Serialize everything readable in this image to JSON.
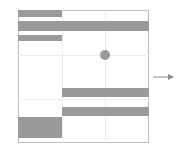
{
  "diagram": {
    "type": "grid-layout",
    "colors": {
      "fill": "#9a9a9a",
      "border": "#bdbdbd",
      "grid": "#ececec"
    },
    "bars": [
      {
        "id": "bar-1",
        "x": 18,
        "y": 10,
        "w": 44,
        "h": 7
      },
      {
        "id": "bar-2",
        "x": 18,
        "y": 21,
        "w": 131,
        "h": 10
      },
      {
        "id": "bar-3",
        "x": 18,
        "y": 35,
        "w": 44,
        "h": 6
      },
      {
        "id": "bar-4",
        "x": 62,
        "y": 88,
        "w": 87,
        "h": 9
      },
      {
        "id": "bar-5",
        "x": 62,
        "y": 107,
        "w": 87,
        "h": 9
      },
      {
        "id": "bar-6",
        "x": 18,
        "y": 117,
        "w": 44,
        "h": 21
      }
    ],
    "dot": {
      "cx": 105,
      "cy": 55,
      "r": 5
    },
    "arrow": {
      "direction": "right"
    }
  }
}
